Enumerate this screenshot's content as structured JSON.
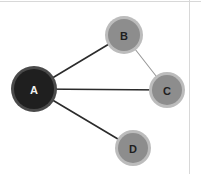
{
  "canvas": {
    "width": 201,
    "height": 174,
    "background": "#ffffff",
    "border_color": "#d8d8d8"
  },
  "chart_data": {
    "type": "diagram",
    "diagram_kind": "node-link-graph",
    "title": "",
    "directed": false,
    "nodes": [
      {
        "id": "A",
        "label": "A",
        "x": 34,
        "y": 89,
        "radius": 20,
        "halo_radius": 23,
        "fill": "#1f1f1f",
        "halo_fill": "#4a4a4a",
        "label_color": "#f2f2f2",
        "label_size": 11,
        "degree": 3
      },
      {
        "id": "B",
        "label": "B",
        "x": 124,
        "y": 35,
        "radius": 16,
        "halo_radius": 19,
        "fill": "#8d8d8d",
        "halo_fill": "#bcbcbc",
        "label_color": "#1f1f1f",
        "label_size": 11,
        "degree": 2
      },
      {
        "id": "C",
        "label": "C",
        "x": 167,
        "y": 90,
        "radius": 15,
        "halo_radius": 18,
        "fill": "#8d8d8d",
        "halo_fill": "#bcbcbc",
        "label_color": "#1f1f1f",
        "label_size": 11,
        "degree": 2
      },
      {
        "id": "D",
        "label": "D",
        "x": 133,
        "y": 148,
        "radius": 15,
        "halo_radius": 18,
        "fill": "#8d8d8d",
        "halo_fill": "#bcbcbc",
        "label_color": "#1f1f1f",
        "label_size": 11,
        "degree": 1
      }
    ],
    "edges": [
      {
        "id": "A-B",
        "source": "A",
        "target": "B",
        "color": "#2b2b2b",
        "width": 1.6,
        "x1": 34,
        "y1": 89,
        "x2": 124,
        "y2": 35
      },
      {
        "id": "A-C",
        "source": "A",
        "target": "C",
        "color": "#2b2b2b",
        "width": 1.6,
        "x1": 34,
        "y1": 89,
        "x2": 167,
        "y2": 90
      },
      {
        "id": "A-D",
        "source": "A",
        "target": "D",
        "color": "#2b2b2b",
        "width": 1.6,
        "x1": 34,
        "y1": 89,
        "x2": 133,
        "y2": 148
      },
      {
        "id": "B-C",
        "source": "B",
        "target": "C",
        "color": "#9a9a9a",
        "width": 1.1,
        "x1": 124,
        "y1": 35,
        "x2": 167,
        "y2": 90
      }
    ],
    "node_count": 4,
    "edge_count": 4,
    "legend": [],
    "annotations": []
  }
}
